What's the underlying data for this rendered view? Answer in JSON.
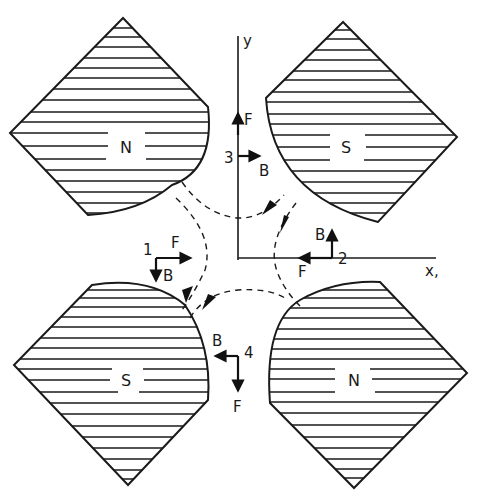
{
  "figure": {
    "type": "quadrupole magnet cross-section",
    "colors": {
      "ink": "#1a1a1a",
      "background": "#ffffff"
    },
    "poles": [
      {
        "id": "top-left",
        "label": "N"
      },
      {
        "id": "top-right",
        "label": "S"
      },
      {
        "id": "bottom-left",
        "label": "S"
      },
      {
        "id": "bottom-right",
        "label": "N"
      }
    ],
    "axes": {
      "x_label": "x,",
      "y_label": "y"
    },
    "positions": [
      {
        "number": "1",
        "field_label": "B",
        "force_label": "F",
        "field_dir": "down",
        "force_dir": "right"
      },
      {
        "number": "2",
        "field_label": "B",
        "force_label": "F",
        "field_dir": "up",
        "force_dir": "left"
      },
      {
        "number": "3",
        "field_label": "B",
        "force_label": "F",
        "field_dir": "right",
        "force_dir": "up"
      },
      {
        "number": "4",
        "field_label": "B",
        "force_label": "F",
        "field_dir": "left",
        "force_dir": "down"
      }
    ],
    "field_lines": "dashed, directed from N poles toward S poles"
  }
}
